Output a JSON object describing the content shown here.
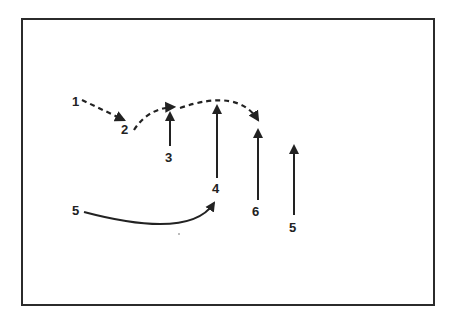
{
  "diagram": {
    "labels": {
      "l1": "1",
      "l2": "2",
      "l3": "3",
      "l4": "4",
      "l5a": "5",
      "l6": "6",
      "l5b": "5"
    },
    "colors": {
      "stroke": "#222222",
      "border": "#2b2b2b",
      "background": "#ffffff"
    }
  }
}
